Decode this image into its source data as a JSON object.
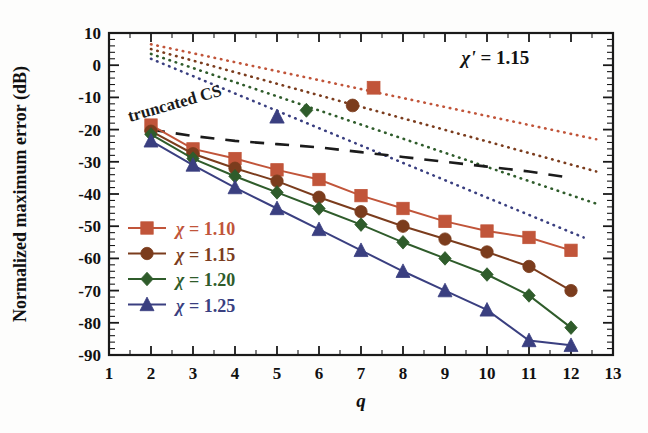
{
  "chart_data": {
    "type": "line",
    "title": "",
    "xlabel": "q",
    "ylabel": "Normalized maximum error (dB)",
    "xlim": [
      1,
      13
    ],
    "ylim": [
      -90,
      10
    ],
    "xticks": [
      1,
      2,
      3,
      4,
      5,
      6,
      7,
      8,
      9,
      10,
      11,
      12,
      13
    ],
    "yticks": [
      10,
      0,
      -10,
      -20,
      -30,
      -40,
      -50,
      -60,
      -70,
      -80,
      -90
    ],
    "xtick_labels": [
      "1",
      "2",
      "3",
      "4",
      "5",
      "6",
      "7",
      "8",
      "9",
      "10",
      "11",
      "12",
      "13"
    ],
    "ytick_labels": [
      "10",
      "0",
      "-10",
      "-20",
      "-30",
      "-40",
      "-50",
      "-60",
      "-70",
      "-80",
      "-90"
    ],
    "x_minor_step": 0.5,
    "y_minor_step": 2,
    "grid": false,
    "legend_position": "lower-left-inside",
    "annotations": [
      {
        "name": "chi-prime-annotation",
        "text": "χ' = 1.15",
        "x": 10.2,
        "y": 0.5
      },
      {
        "name": "truncated-cs-annotation",
        "text": "truncated CS",
        "x": 2.6,
        "y": -13.5,
        "rotation": -16
      }
    ],
    "x": [
      2,
      3,
      4,
      5,
      6,
      7,
      8,
      9,
      10,
      11,
      12
    ],
    "series": [
      {
        "name": "χ = 1.10",
        "legend_label": "χ = 1.10",
        "color": "#c1553a",
        "marker": "square",
        "values": [
          -18.6,
          -26.0,
          -29.0,
          -32.5,
          -35.5,
          -40.5,
          -44.5,
          -48.5,
          -51.5,
          -53.5,
          -57.5
        ]
      },
      {
        "name": "χ = 1.15",
        "legend_label": "χ = 1.15",
        "color": "#7b3c1d",
        "marker": "circle",
        "values": [
          -20.5,
          -27.5,
          -32.0,
          -36.0,
          -41.0,
          -45.5,
          -50.0,
          -54.0,
          -58.0,
          -62.5,
          -70.0
        ]
      },
      {
        "name": "χ = 1.20",
        "legend_label": "χ = 1.20",
        "color": "#2f5c2b",
        "marker": "diamond",
        "values": [
          -21.5,
          -29.0,
          -34.5,
          -39.5,
          -44.5,
          -49.5,
          -55.0,
          -60.0,
          -65.0,
          -71.5,
          -81.5
        ]
      },
      {
        "name": "χ = 1.25",
        "legend_label": "χ = 1.25",
        "color": "#3a3f80",
        "marker": "triangle",
        "values": [
          -23.5,
          -31.0,
          -38.0,
          -44.5,
          -51.0,
          -57.5,
          -64.0,
          -70.0,
          -76.0,
          -85.5,
          -87.0
        ]
      }
    ],
    "dotted_series": [
      {
        "name": "dotted-chi-1.10",
        "color": "#c1553a",
        "marker": "square",
        "x_start": 2.0,
        "y_start": 6.5,
        "x_end": 12.6,
        "y_end": -23.0,
        "marker_x": 7.3,
        "marker_y": -7.0
      },
      {
        "name": "dotted-chi-1.15",
        "color": "#7b3c1d",
        "marker": "circle",
        "x_start": 2.0,
        "y_start": 5.0,
        "x_end": 12.6,
        "y_end": -33.0,
        "marker_x": 6.8,
        "marker_y": -12.5
      },
      {
        "name": "dotted-chi-1.20",
        "color": "#2f5c2b",
        "marker": "diamond",
        "x_start": 2.0,
        "y_start": 3.5,
        "x_end": 12.6,
        "y_end": -43.0,
        "marker_x": 5.7,
        "marker_y": -14.0
      },
      {
        "name": "dotted-chi-1.25",
        "color": "#3a3f80",
        "marker": "triangle",
        "x_start": 2.0,
        "y_start": 2.0,
        "x_end": 12.3,
        "y_end": -53.5,
        "marker_x": 5.0,
        "marker_y": -16.0
      }
    ],
    "dashed_reference": {
      "name": "truncated-CS",
      "color": "#1b1b1b",
      "x": [
        2.0,
        3.0,
        4.0,
        5.0,
        6.0,
        7.0,
        8.0,
        9.0,
        10.0,
        11.0,
        12.0
      ],
      "values": [
        -20.0,
        -22.0,
        -23.5,
        -24.5,
        -25.5,
        -27.0,
        -28.5,
        -30.0,
        -31.5,
        -33.0,
        -35.0
      ]
    }
  },
  "legend": {
    "items": [
      {
        "label": "χ = 1.10",
        "color": "#c1553a",
        "marker": "square"
      },
      {
        "label": "χ = 1.15",
        "color": "#7b3c1d",
        "marker": "circle"
      },
      {
        "label": "χ = 1.20",
        "color": "#2f5c2b",
        "marker": "diamond"
      },
      {
        "label": "χ = 1.25",
        "color": "#3a3f80",
        "marker": "triangle"
      }
    ]
  },
  "axes": {
    "x_title": "q",
    "y_title": "Normalized maximum error (dB)"
  },
  "annotation_texts": {
    "chi_prime": "χ' = 1.15",
    "truncated_cs": "truncated CS"
  }
}
